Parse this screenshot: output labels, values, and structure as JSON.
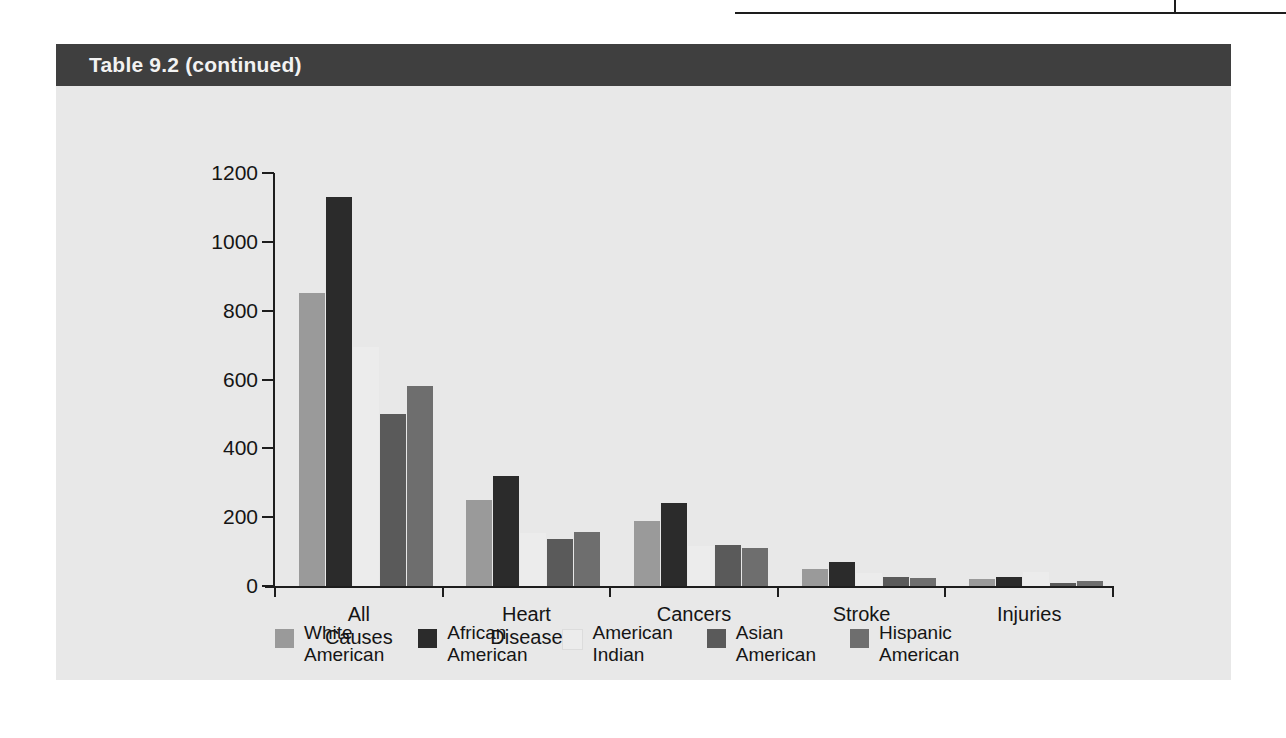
{
  "header": {
    "title": "Table 9.2 (continued)"
  },
  "chart_data": {
    "type": "bar",
    "title": "",
    "xlabel": "",
    "ylabel": "",
    "ylim": [
      0,
      1200
    ],
    "yticks": [
      0,
      200,
      400,
      600,
      800,
      1000,
      1200
    ],
    "grid": false,
    "legend_position": "bottom",
    "categories": [
      "All\nCauses",
      "Heart\nDisease",
      "Cancers",
      "Stroke",
      "Injuries"
    ],
    "series": [
      {
        "name": "White\nAmerican",
        "color": "#9a9a9a",
        "values": [
          850,
          250,
          190,
          48,
          20
        ]
      },
      {
        "name": "African\nAmerican",
        "color": "#2b2b2b",
        "values": [
          1130,
          320,
          242,
          70,
          27
        ]
      },
      {
        "name": "American\nIndian",
        "color": "#ececec",
        "values": [
          695,
          155,
          117,
          38,
          40
        ]
      },
      {
        "name": "Asian\nAmerican",
        "color": "#5a5a5a",
        "values": [
          500,
          137,
          120,
          26,
          8
        ]
      },
      {
        "name": "Hispanic\nAmerican",
        "color": "#6e6e6e",
        "values": [
          580,
          157,
          110,
          24,
          15
        ]
      }
    ]
  }
}
